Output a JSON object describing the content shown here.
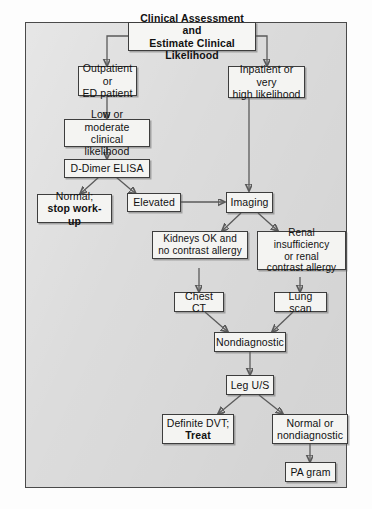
{
  "figure": {
    "type": "clinical-algorithm-flowchart"
  },
  "nodes": {
    "assessment": {
      "line1": "Clinical Assessment and",
      "line2": "Estimate Clinical Likelihood"
    },
    "outpatient": {
      "line1": "Outpatient or",
      "line2": "ED patient"
    },
    "inpatient": {
      "line1": "Inpatient or very",
      "line2": "high likelihood"
    },
    "low_moderate": {
      "line1": "Low or moderate",
      "line2": "clinical likelihood"
    },
    "ddimer": {
      "line1": "D-Dimer ELISA"
    },
    "normal_stop": {
      "line1": "Normal;",
      "line2": "stop work-up"
    },
    "elevated": {
      "line1": "Elevated"
    },
    "imaging": {
      "line1": "Imaging"
    },
    "kidneys_ok": {
      "line1": "Kidneys OK and",
      "line2": "no contrast allergy"
    },
    "renal_insuff": {
      "line1": "Renal insufficiency",
      "line2": "or renal",
      "line3": "contrast allergy"
    },
    "chest_ct": {
      "line1": "Chest CT"
    },
    "lung_scan": {
      "line1": "Lung scan"
    },
    "nondiagnostic": {
      "line1": "Nondiagnostic"
    },
    "leg_us": {
      "line1": "Leg U/S"
    },
    "definite_dvt": {
      "line1": "Definite DVT;",
      "line2": "Treat"
    },
    "normal_nondx": {
      "line1": "Normal or",
      "line2": "nondiagnostic"
    },
    "pa_gram": {
      "line1": "PA gram"
    }
  },
  "colors": {
    "panel_background": "#dcdcdc",
    "panel_border": "#4a4a4a",
    "box_fill": "#f4f4f2",
    "box_border": "#3d3d3d",
    "connector": "#5a5a5a",
    "text": "#111111"
  }
}
